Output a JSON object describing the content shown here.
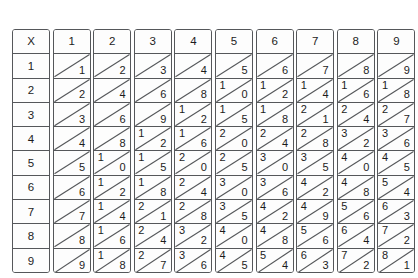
{
  "document": {
    "title": "Multiplication Table 1-9",
    "corner_label": "X",
    "column_headers": [
      "1",
      "2",
      "3",
      "4",
      "5",
      "6",
      "7",
      "8",
      "9"
    ],
    "row_headers": [
      "1",
      "2",
      "3",
      "4",
      "5",
      "6",
      "7",
      "8",
      "9"
    ],
    "style": {
      "border_color": "#55575a",
      "text_color": "#1c1c1c",
      "background": "#ffffff",
      "diagonal_direction": "bottom-left-to-top-right"
    },
    "products": [
      [
        "1",
        "2",
        "3",
        "4",
        "5",
        "6",
        "7",
        "8",
        "9"
      ],
      [
        "2",
        "4",
        "6",
        "8",
        "10",
        "12",
        "14",
        "16",
        "18"
      ],
      [
        "3",
        "6",
        "9",
        "12",
        "15",
        "18",
        "21",
        "24",
        "27"
      ],
      [
        "4",
        "8",
        "12",
        "16",
        "20",
        "24",
        "28",
        "32",
        "36"
      ],
      [
        "5",
        "10",
        "15",
        "20",
        "25",
        "30",
        "35",
        "40",
        "45"
      ],
      [
        "6",
        "12",
        "18",
        "24",
        "30",
        "36",
        "42",
        "48",
        "54"
      ],
      [
        "7",
        "14",
        "21",
        "28",
        "35",
        "42",
        "49",
        "56",
        "63"
      ],
      [
        "8",
        "16",
        "24",
        "32",
        "40",
        "48",
        "56",
        "64",
        "72"
      ],
      [
        "9",
        "18",
        "27",
        "36",
        "45",
        "54",
        "63",
        "72",
        "81"
      ]
    ]
  }
}
